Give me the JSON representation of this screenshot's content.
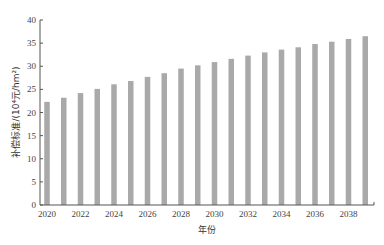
{
  "chart_data": {
    "type": "bar",
    "title": "",
    "xlabel": "年份",
    "ylabel": "补偿标准/(10⁴元/hm²)",
    "ylim": [
      0,
      40
    ],
    "yticks": [
      0,
      5,
      10,
      15,
      20,
      25,
      30,
      35,
      40
    ],
    "xtick_labels": [
      "2020",
      "2022",
      "2024",
      "2026",
      "2028",
      "2030",
      "2032",
      "2034",
      "2036",
      "2038"
    ],
    "grid": false,
    "legend": null,
    "bar_color": "#a9a9a9",
    "categories": [
      "2020",
      "2021",
      "2022",
      "2023",
      "2024",
      "2025",
      "2026",
      "2027",
      "2028",
      "2029",
      "2030",
      "2031",
      "2032",
      "2033",
      "2034",
      "2035",
      "2036",
      "2037",
      "2038",
      "2039"
    ],
    "values": [
      22.3,
      23.2,
      24.2,
      25.1,
      26.1,
      26.8,
      27.7,
      28.5,
      29.5,
      30.2,
      30.9,
      31.6,
      32.3,
      33.0,
      33.6,
      34.1,
      34.8,
      35.3,
      35.9,
      36.5
    ]
  }
}
